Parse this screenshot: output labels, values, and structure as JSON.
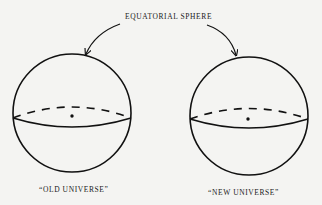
{
  "diagram": {
    "title": "EQUATORIAL SPHERE",
    "spheres": [
      {
        "label": "“OLD UNIVERSE”",
        "cx": 72,
        "cy": 113,
        "r": 59,
        "center_dot": {
          "x": 72,
          "y": 116
        }
      },
      {
        "label": "“NEW UNIVERSE”",
        "cx": 249,
        "cy": 116,
        "r": 59,
        "center_dot": {
          "x": 248,
          "y": 119
        }
      }
    ],
    "arrows": [
      {
        "from": "title",
        "to": "old-universe-sphere-top"
      },
      {
        "from": "title",
        "to": "new-universe-sphere-top"
      }
    ],
    "colors": {
      "background": "#f4f4f2",
      "ink": "#111111"
    }
  }
}
